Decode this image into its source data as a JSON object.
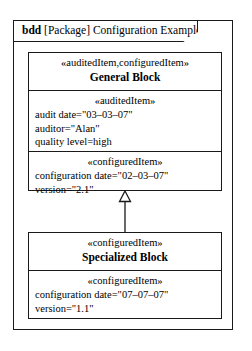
{
  "frame": {
    "kind": "bdd",
    "qualifier": "[Package]",
    "name": "Configuration Example",
    "label_rest": " [Package] Configuration Example"
  },
  "blocks": [
    {
      "id": "general-block",
      "stereotype": "«abuditedItem,configuredItem»",
      "stereotype_text": "«auditedItem,configuredItem»",
      "name": "General Block",
      "compartments": [
        {
          "id": "audited-item",
          "stereotype": "«auditedItem»",
          "properties": [
            "audit date=\"03–03–07\"",
            "auditor=\"Alan\"",
            "quality level=high"
          ]
        },
        {
          "id": "configured-item",
          "stereotype": "«configuredItem»",
          "properties": [
            "configuration date=\"02–03–07\"",
            "version=\"2.1\""
          ]
        }
      ]
    },
    {
      "id": "specialized-block",
      "stereotype_text": "«configuredItem»",
      "name": "Specialized Block",
      "compartments": [
        {
          "id": "configured-item",
          "stereotype": "«configuredItem»",
          "properties": [
            "configuration date=\"07–07–07\"",
            "version=\"1.1\""
          ]
        }
      ]
    }
  ],
  "relationships": [
    {
      "type": "generalization",
      "from": "specialized-block",
      "to": "general-block"
    }
  ],
  "colors": {
    "line": "#1a1a1a",
    "background": "#ffffff",
    "text": "#000000"
  }
}
